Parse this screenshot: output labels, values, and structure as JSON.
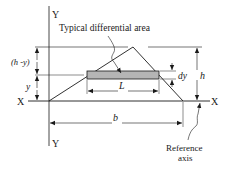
{
  "diagram": {
    "title_annotation": "Typical differential area",
    "axes": {
      "y_top_label": "Y",
      "y_bottom_label": "Y",
      "x_left_label": "X",
      "x_right_label": "X"
    },
    "dimensions": {
      "h_minus_y": "(h -y)",
      "y": "y",
      "h": "h",
      "dy": "dy",
      "L": "L",
      "b": "b"
    },
    "reference_axis": {
      "line1": "Reference",
      "line2": "axis"
    },
    "colors": {
      "line": "#1a1a1a",
      "strip_fill": "#b5b5b5",
      "background": "#ffffff"
    }
  }
}
